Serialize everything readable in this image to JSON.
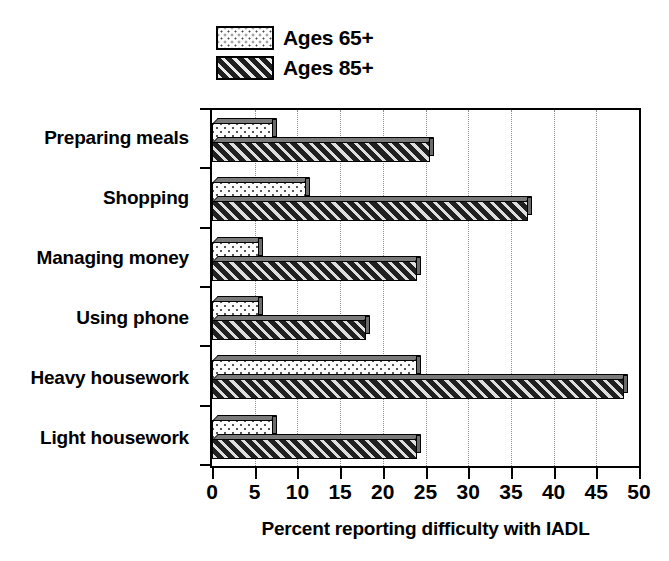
{
  "chart_data": {
    "type": "bar",
    "orientation": "horizontal",
    "title": "",
    "xlabel": "Percent reporting difficulty with IADL",
    "ylabel": "",
    "xlim": [
      0,
      50
    ],
    "xticks": [
      0,
      5,
      10,
      15,
      20,
      25,
      30,
      35,
      40,
      45,
      50
    ],
    "grid": "vertical-dotted",
    "legend_position": "top-center",
    "categories": [
      "Preparing meals",
      "Shopping",
      "Managing money",
      "Using phone",
      "Heavy  housework",
      "Light housework"
    ],
    "series": [
      {
        "name": "Ages 65+",
        "pattern": "dotted",
        "values": [
          7.2,
          11.0,
          5.5,
          5.5,
          24.0,
          7.2
        ]
      },
      {
        "name": "Ages 85+",
        "pattern": "diagonal-hatch",
        "values": [
          25.5,
          37.0,
          24.0,
          18.0,
          48.3,
          24.0
        ]
      }
    ]
  },
  "legend": {
    "items": [
      {
        "label": "Ages 65+",
        "swatch": "dotted-swatch"
      },
      {
        "label": "Ages 85+",
        "swatch": "hatched-swatch"
      }
    ]
  }
}
